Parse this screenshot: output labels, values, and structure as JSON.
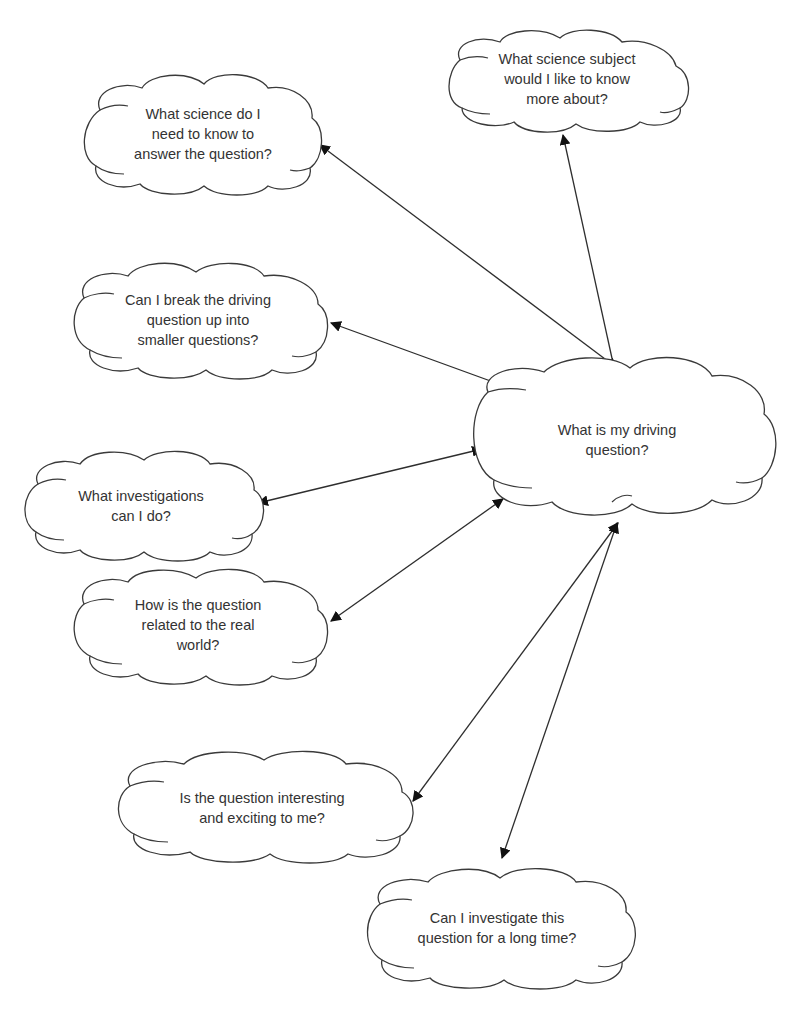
{
  "diagram": {
    "type": "concept-map",
    "center": {
      "id": "driving-question",
      "lines": [
        "What is my driving",
        "question?"
      ],
      "cx": 617,
      "cy": 440
    },
    "nodes": [
      {
        "id": "science-subject",
        "lines": [
          "What science subject",
          "would I like to know",
          "more about?"
        ],
        "cx": 567,
        "cy": 79
      },
      {
        "id": "science-needed",
        "lines": [
          "What science do I",
          "need to know to",
          "answer the question?"
        ],
        "cx": 203,
        "cy": 134
      },
      {
        "id": "break-up",
        "lines": [
          "Can I break the driving",
          "question up into",
          "smaller questions?"
        ],
        "cx": 198,
        "cy": 320
      },
      {
        "id": "investigations",
        "lines": [
          "What investigations",
          "can I do?"
        ],
        "cx": 141,
        "cy": 506
      },
      {
        "id": "real-world",
        "lines": [
          "How is the question",
          "related to the real",
          "world?"
        ],
        "cx": 198,
        "cy": 625
      },
      {
        "id": "interesting",
        "lines": [
          "Is the question interesting",
          "and exciting to me?"
        ],
        "cx": 262,
        "cy": 808
      },
      {
        "id": "long-time",
        "lines": [
          "Can I investigate this",
          "question for a long time?"
        ],
        "cx": 497,
        "cy": 928
      }
    ],
    "connections": [
      {
        "from": "science-subject",
        "to": "driving-question",
        "x1": 563,
        "y1": 135,
        "x2": 615,
        "y2": 372,
        "bidirectional": true
      },
      {
        "from": "science-needed",
        "to": "driving-question",
        "x1": 320,
        "y1": 145,
        "x2": 617,
        "y2": 368,
        "bidirectional": true
      },
      {
        "from": "break-up",
        "to": "driving-question",
        "x1": 331,
        "y1": 323,
        "x2": 507,
        "y2": 387,
        "bidirectional": true
      },
      {
        "from": "investigations",
        "to": "driving-question",
        "x1": 258,
        "y1": 503,
        "x2": 482,
        "y2": 449,
        "bidirectional": true
      },
      {
        "from": "real-world",
        "to": "driving-question",
        "x1": 331,
        "y1": 621,
        "x2": 503,
        "y2": 499,
        "bidirectional": true
      },
      {
        "from": "interesting",
        "to": "driving-question",
        "x1": 413,
        "y1": 801,
        "x2": 618,
        "y2": 523,
        "bidirectional": true
      },
      {
        "from": "long-time",
        "to": "driving-question",
        "x1": 502,
        "y1": 858,
        "x2": 617,
        "y2": 523,
        "bidirectional": true
      }
    ],
    "colors": {
      "line": "#2e2e2e",
      "text": "#333333",
      "background": "#ffffff"
    }
  }
}
